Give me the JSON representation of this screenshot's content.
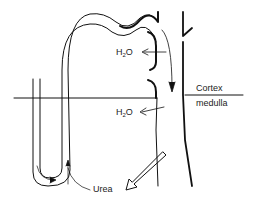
{
  "diagram": {
    "labels": {
      "h2o_upper_main": "H",
      "h2o_upper_sub": "2",
      "h2o_upper_end": "O",
      "h2o_lower_main": "H",
      "h2o_lower_sub": "2",
      "h2o_lower_end": "O",
      "cortex": "Cortex",
      "medulla": "medulla",
      "urea": "Urea"
    },
    "colors": {
      "stroke": "#111111",
      "background": "#ffffff"
    }
  }
}
